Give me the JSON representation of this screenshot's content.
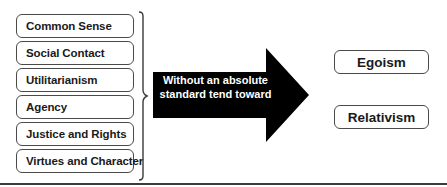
{
  "diagram": {
    "sources": [
      {
        "label": "Common Sense"
      },
      {
        "label": "Social Contact"
      },
      {
        "label": "Utilitarianism"
      },
      {
        "label": "Agency"
      },
      {
        "label": "Justice and Rights"
      },
      {
        "label": "Virtues and Character"
      }
    ],
    "arrow": {
      "line1": "Without an absolute",
      "line2": "standard tend toward",
      "color": "#000000"
    },
    "outcomes": [
      {
        "label": "Egoism"
      },
      {
        "label": "Relativism"
      }
    ],
    "colors": {
      "border": "#4a4a4a",
      "text": "#1a1a1a",
      "rule": "#3a3a3a"
    }
  }
}
